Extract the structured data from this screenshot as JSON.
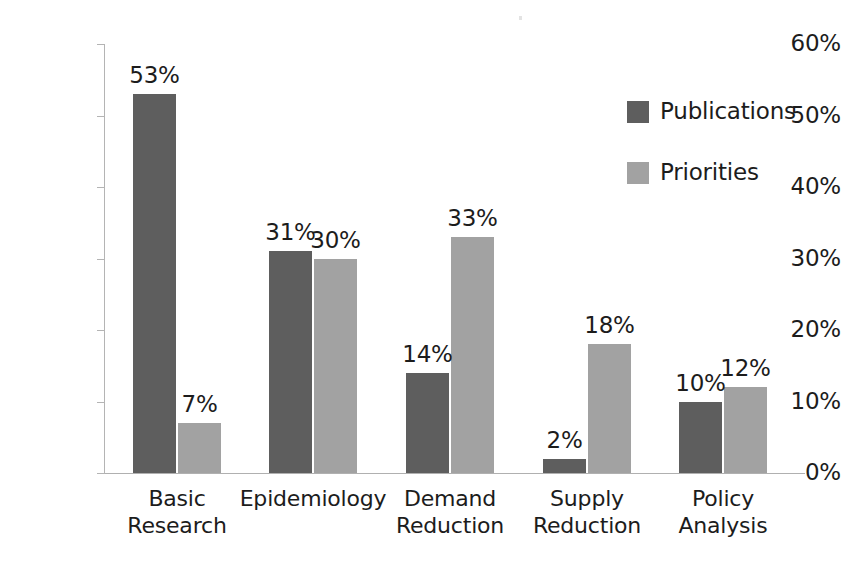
{
  "chart_data": {
    "type": "bar",
    "title": "",
    "subtitle": "",
    "xlabel": "",
    "ylabel": "",
    "categories": [
      "Basic Research",
      "Epidemiology",
      "Demand Reduction",
      "Supply Reduction",
      "Policy Analysis"
    ],
    "category_lines": [
      [
        "Basic",
        "Research"
      ],
      [
        "Epidemiology"
      ],
      [
        "Demand",
        "Reduction"
      ],
      [
        "Supply",
        "Reduction"
      ],
      [
        "Policy",
        "Analysis"
      ]
    ],
    "series": [
      {
        "name": "Publications",
        "color": "#5e5e5e",
        "values": [
          53,
          31,
          14,
          2,
          10
        ],
        "labels": [
          "53%",
          "31%",
          "14%",
          "2%",
          "10%"
        ]
      },
      {
        "name": "Priorities",
        "color": "#a2a2a2",
        "values": [
          7,
          30,
          33,
          18,
          12
        ],
        "labels": [
          "7%",
          "30%",
          "33%",
          "18%",
          "12%"
        ]
      }
    ],
    "ylim": [
      0,
      60
    ],
    "ytick_values": [
      0,
      10,
      20,
      30,
      40,
      50,
      60
    ],
    "ytick_labels": [
      "0%",
      "10%",
      "20%",
      "30%",
      "40%",
      "50%",
      "60%"
    ],
    "grid": false,
    "legend_position": "upper right",
    "value_labels_shown": true,
    "value_suffix": "%"
  },
  "legend": {
    "items": [
      {
        "label": "Publications",
        "color": "#5e5e5e"
      },
      {
        "label": "Priorities",
        "color": "#a2a2a2"
      }
    ]
  },
  "axis": {
    "y_labels": [
      "60%",
      "50%",
      "40%",
      "30%",
      "20%",
      "10%",
      "0%"
    ]
  },
  "colors": {
    "series_dark": "#5e5e5e",
    "series_light": "#a2a2a2",
    "axis": "#b4b4b4",
    "text": "#1c1c1c",
    "background": "#ffffff"
  }
}
